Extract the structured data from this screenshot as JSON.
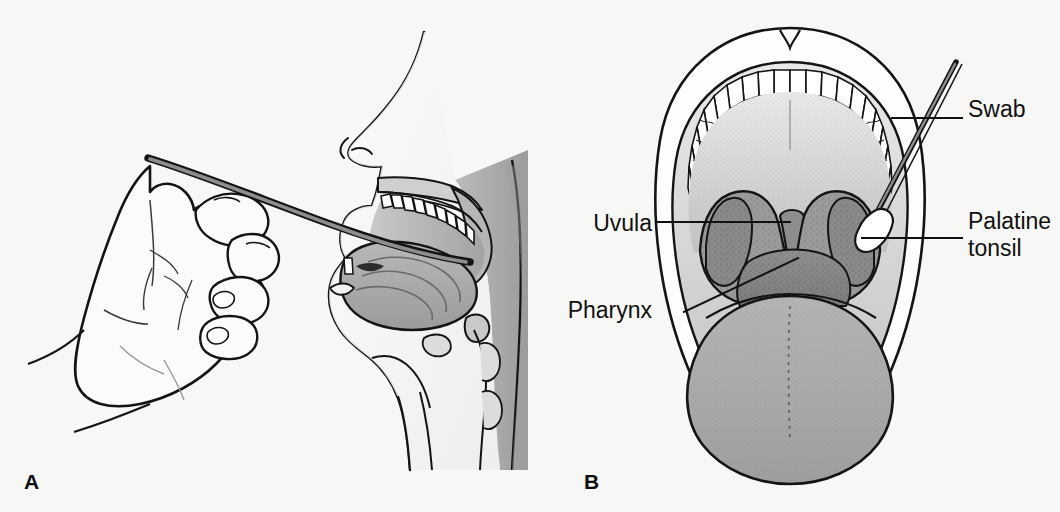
{
  "figure": {
    "kind": "medical-illustration",
    "background_color": "#f7f7f5",
    "ink_color": "#111111"
  },
  "panels": [
    {
      "id": "a",
      "letter": "A",
      "view": "sagittal section of head with hand holding swab entering the mouth",
      "labels": []
    },
    {
      "id": "b",
      "letter": "B",
      "view": "anterior view of open mouth with swab touching palatine tonsil",
      "labels": [
        {
          "id": "swab",
          "text": "Swab",
          "side": "right",
          "lines": [
            "Swab"
          ]
        },
        {
          "id": "palatine",
          "text": "Palatine tonsil",
          "side": "right",
          "lines": [
            "Palatine",
            "tonsil"
          ]
        },
        {
          "id": "uvula",
          "text": "Uvula",
          "side": "left",
          "lines": [
            "Uvula"
          ]
        },
        {
          "id": "pharynx",
          "text": "Pharynx",
          "side": "left",
          "lines": [
            "Pharynx"
          ]
        }
      ]
    }
  ],
  "palette": {
    "background": "#f7f7f5",
    "outline": "#141414",
    "skin_light": "#fbfbfa",
    "skin_shadow": "#d9d9d7",
    "tooth_white": "#ffffff",
    "mucosa_light": "#d6d6d4",
    "tongue_gray": "#a9a9a7",
    "pharynx_gray": "#8a8a88",
    "tonsil_gray": "#9c9c9a",
    "deep_shadow": "#6e6e6c",
    "swab_stick": "#7d7d7b",
    "swab_tip": "#ffffff",
    "leader_line": "#111111"
  }
}
